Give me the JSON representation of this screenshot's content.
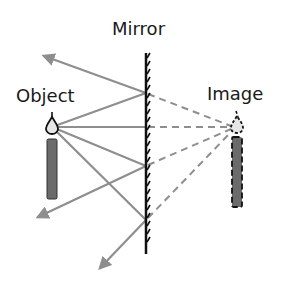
{
  "labels": {
    "mirror": "Mirror",
    "object": "Object",
    "image": "Image"
  },
  "colors": {
    "ray": "#8e8e8e",
    "virtual_ray": "#8e8e8e",
    "mirror": "#111111",
    "candle": "#6b6b6b",
    "flame_fill": "#e6e6e6",
    "outline": "#111111"
  },
  "diagram": {
    "mirror_x": 146,
    "mirror_top": 53,
    "mirror_bottom": 254,
    "object_flame": [
      52,
      127
    ],
    "image_flame": [
      233,
      127
    ],
    "rays": [
      {
        "from": [
          52,
          127
        ],
        "hit": [
          146,
          93
        ],
        "reflect_to": [
          42,
          55
        ]
      },
      {
        "from": [
          52,
          127
        ],
        "hit": [
          146,
          127
        ],
        "reflect_to": null
      },
      {
        "from": [
          52,
          127
        ],
        "hit": [
          146,
          166
        ],
        "reflect_to": [
          36,
          218
        ]
      },
      {
        "from": [
          52,
          127
        ],
        "hit": [
          146,
          220
        ],
        "reflect_to": [
          99,
          270
        ]
      }
    ]
  }
}
